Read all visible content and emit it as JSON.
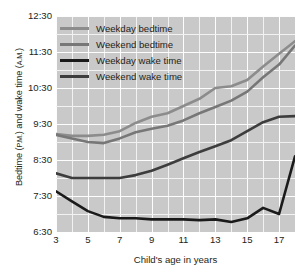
{
  "chart_data": {
    "type": "line",
    "title": "",
    "xlabel": "Child's age in years",
    "ylabel": "Bedtime (P.M.) and wake time (A.M.)",
    "ylabel_main": "Bedtime (",
    "ylabel_pm": "P.M.",
    "ylabel_mid": ") and wake time (",
    "ylabel_am": "A.M.",
    "ylabel_end": ")",
    "x": [
      3,
      4,
      5,
      6,
      7,
      8,
      9,
      10,
      11,
      12,
      13,
      14,
      15,
      16,
      17,
      18
    ],
    "xlim": [
      3,
      18
    ],
    "xticks": [
      3,
      5,
      7,
      9,
      11,
      13,
      15,
      17
    ],
    "xtick_labels": [
      "3",
      "5",
      "7",
      "9",
      "11",
      "13",
      "15",
      "17"
    ],
    "ylim": [
      6.5,
      12.5
    ],
    "yticks": [
      6.5,
      7.5,
      8.5,
      9.5,
      10.5,
      11.5,
      12.5
    ],
    "ytick_labels": [
      "6:30",
      "7:30",
      "8:30",
      "9:30",
      "10:30",
      "11:30",
      "12:30"
    ],
    "y_minor_step": 0.5,
    "grid": true,
    "legend_position": "top-left",
    "series": [
      {
        "name": "Weekday bedtime",
        "color": "#8c8c8c",
        "values": [
          9.22,
          9.17,
          9.17,
          9.2,
          9.3,
          9.53,
          9.7,
          9.8,
          10.0,
          10.2,
          10.5,
          10.55,
          10.72,
          11.1,
          11.45,
          11.8
        ]
      },
      {
        "name": "Weekend bedtime",
        "color": "#777777",
        "values": [
          9.2,
          9.1,
          9.0,
          8.97,
          9.1,
          9.27,
          9.37,
          9.45,
          9.6,
          9.8,
          9.97,
          10.15,
          10.4,
          10.8,
          11.15,
          11.68
        ]
      },
      {
        "name": "Weekday wake time",
        "color": "#1a1a1a",
        "values": [
          7.63,
          7.35,
          7.08,
          6.92,
          6.88,
          6.88,
          6.85,
          6.85,
          6.85,
          6.83,
          6.85,
          6.78,
          6.88,
          7.17,
          7.0,
          8.6
        ]
      },
      {
        "name": "Weekend wake time",
        "color": "#3d3d3d",
        "values": [
          8.13,
          8.0,
          8.0,
          8.0,
          8.0,
          8.08,
          8.2,
          8.37,
          8.55,
          8.72,
          8.88,
          9.05,
          9.3,
          9.55,
          9.7,
          9.72
        ]
      }
    ]
  },
  "legend": {
    "items": [
      {
        "label": "Weekday bedtime",
        "color": "#8c8c8c"
      },
      {
        "label": "Weekend bedtime",
        "color": "#777777"
      },
      {
        "label": "Weekday wake time",
        "color": "#1a1a1a"
      },
      {
        "label": "Weekend wake time",
        "color": "#3d3d3d"
      }
    ]
  },
  "colors": {
    "plot_background": "#c9c9c9",
    "gridline": "#f2f2f2",
    "text": "#231f20",
    "page_background": "#ffffff"
  }
}
